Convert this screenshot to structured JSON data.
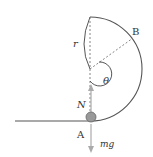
{
  "diagram": {
    "labels": {
      "radius": "r",
      "point_b": "B",
      "angle": "θ",
      "normal_force": "N",
      "point_a": "A",
      "weight": "mg"
    },
    "colors": {
      "line": "#555555",
      "dashed": "#777777",
      "arrow": "#aaaaaa",
      "ball_fill": "#999999",
      "ball_stroke": "#666666",
      "text": "#333333"
    }
  }
}
